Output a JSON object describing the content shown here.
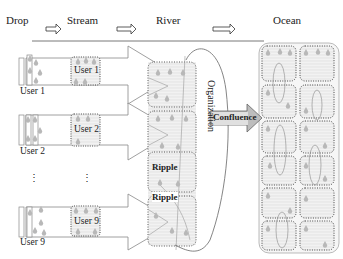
{
  "header": {
    "stages": [
      "Drop",
      "Stream",
      "River",
      "Ocean"
    ]
  },
  "users": [
    {
      "drop_label": "User 1",
      "stream_label": "User 1"
    },
    {
      "drop_label": "User 2",
      "stream_label": "User 2"
    },
    {
      "drop_label": "User 9",
      "stream_label": "User 9"
    }
  ],
  "ellipsis": "⋮",
  "river": {
    "ripple_labels": [
      "Ripple",
      "Ripple"
    ],
    "organization_label": "Organization"
  },
  "confluence_label": "Confluence",
  "colors": {
    "line": "#7a7a7a",
    "dotted": "#555555",
    "fill": "#ececec",
    "drop": "#bdbdbd"
  }
}
